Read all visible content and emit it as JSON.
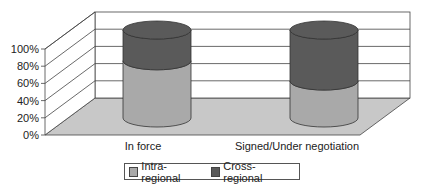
{
  "chart_data": {
    "type": "bar",
    "subtype": "3d-stacked-cylinder-100-percent",
    "title": "",
    "xlabel": "",
    "ylabel": "",
    "categories": [
      "In force",
      "Signed/Under negotiation"
    ],
    "series": [
      {
        "name": "Intra-regional",
        "values": [
          65,
          42
        ],
        "color": "#a9a9a9"
      },
      {
        "name": "Cross-regional",
        "values": [
          35,
          58
        ],
        "color": "#5a5a5a"
      }
    ],
    "yticks": [
      "0%",
      "20%",
      "40%",
      "60%",
      "80%",
      "100%"
    ],
    "ylim": [
      0,
      100
    ],
    "grid": true,
    "legend_position": "bottom"
  },
  "legend": {
    "items": [
      {
        "label": "Intra-regional"
      },
      {
        "label": "Cross-regional"
      }
    ]
  }
}
